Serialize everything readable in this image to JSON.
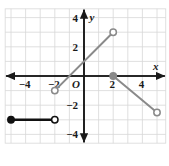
{
  "figure": {
    "kind": "coordinate-plane-piecewise-graph",
    "background": "#ffffff",
    "grid_color": "#d8d8d8",
    "axis_color": "#1a1a1a",
    "segment_gray": "#8a8a8a",
    "segment_black": "#111111"
  },
  "axes": {
    "x_label": "x",
    "y_label": "y",
    "origin_label": "O",
    "x_ticks": [
      {
        "value": -4,
        "label": "−4"
      },
      {
        "value": -2,
        "label": "−2"
      },
      {
        "value": 2,
        "label": "2"
      },
      {
        "value": 4,
        "label": "4"
      }
    ],
    "y_ticks": [
      {
        "value": 4,
        "label": "4"
      },
      {
        "value": 2,
        "label": "2"
      },
      {
        "value": -2,
        "label": "−2"
      },
      {
        "value": -4,
        "label": "−4"
      }
    ],
    "xlim": [
      -5.4,
      5.6
    ],
    "ylim": [
      -4.6,
      4.6
    ],
    "x_arrows": "both",
    "y_arrows": "both"
  },
  "chart_data": {
    "type": "line",
    "title": "",
    "xlabel": "x",
    "ylabel": "y",
    "xlim": [
      -5.4,
      5.6
    ],
    "ylim": [
      -4.6,
      4.6
    ],
    "grid": true,
    "legend": "none",
    "series": [
      {
        "name": "segment-1",
        "color": "#111111",
        "x": [
          -5,
          -2
        ],
        "y": [
          -3,
          -3
        ],
        "start_point": {
          "x": -5,
          "y": -3,
          "style": "closed"
        },
        "end_point": {
          "x": -2,
          "y": -3,
          "style": "open"
        }
      },
      {
        "name": "segment-2",
        "color": "#8a8a8a",
        "x": [
          -2,
          2
        ],
        "y": [
          -1,
          3
        ],
        "start_point": {
          "x": -2,
          "y": -1,
          "style": "open"
        },
        "end_point": {
          "x": 2,
          "y": 3,
          "style": "open"
        }
      },
      {
        "name": "segment-3",
        "color": "#8a8a8a",
        "x": [
          2,
          5
        ],
        "y": [
          0,
          -2.5
        ],
        "start_point": {
          "x": 2,
          "y": 0,
          "style": "closed"
        },
        "end_point": {
          "x": 5,
          "y": -2.5,
          "style": "open"
        }
      }
    ]
  }
}
